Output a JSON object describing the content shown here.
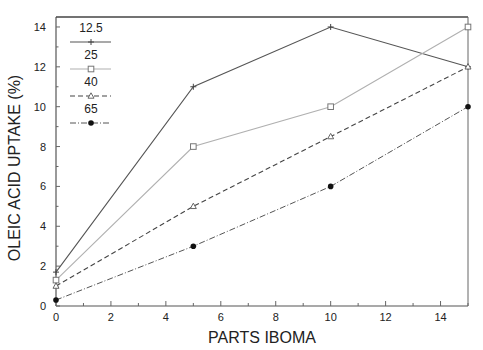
{
  "chart_data": {
    "type": "line",
    "title": "",
    "xlabel": "PARTS IBOMA",
    "ylabel": "OLEIC ACID UPTAKE (%)",
    "xlim": [
      0,
      15
    ],
    "ylim": [
      0,
      14.5
    ],
    "x_ticks": [
      0,
      2,
      4,
      6,
      8,
      10,
      12,
      14
    ],
    "y_ticks": [
      0,
      2,
      4,
      6,
      8,
      10,
      12,
      14
    ],
    "grid": false,
    "legend_position": "upper left (inside)",
    "x": [
      0,
      5,
      10,
      15
    ],
    "series": [
      {
        "name": "12.5",
        "values": [
          1.7,
          11,
          14,
          12
        ],
        "marker": "plus",
        "line": "solid",
        "color": "#555555"
      },
      {
        "name": "25",
        "values": [
          1.3,
          8,
          10,
          14
        ],
        "marker": "open-square",
        "line": "solid-light",
        "color": "#aaaaaa"
      },
      {
        "name": "40",
        "values": [
          1.0,
          5,
          8.5,
          12
        ],
        "marker": "open-triangle",
        "line": "dashed",
        "color": "#444444"
      },
      {
        "name": "65",
        "values": [
          0.3,
          3,
          6,
          10
        ],
        "marker": "filled-circle",
        "line": "dash-dot",
        "color": "#444444"
      }
    ]
  }
}
